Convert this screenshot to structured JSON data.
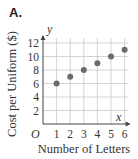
{
  "panel": {
    "label": "A."
  },
  "chart_data": {
    "type": "scatter",
    "title": "",
    "xlabel": "Number of Letters",
    "ylabel": "Cost per Uniform ($)",
    "x_axis_name": "x",
    "y_axis_name": "y",
    "origin_label": "O",
    "x": [
      1,
      2,
      3,
      4,
      5,
      6
    ],
    "y": [
      6,
      7,
      8,
      9,
      10,
      11
    ],
    "xlim": [
      0,
      6
    ],
    "ylim": [
      0,
      12
    ],
    "x_ticks": [
      "1",
      "2",
      "3",
      "4",
      "5",
      "6"
    ],
    "y_ticks": [
      "2",
      "4",
      "6",
      "8",
      "10",
      "12"
    ],
    "grid": true,
    "legend": null
  },
  "colors": {
    "point": "#6b6b6b",
    "grid": "#c8c8c8",
    "axis": "#444444",
    "text": "#333333"
  }
}
